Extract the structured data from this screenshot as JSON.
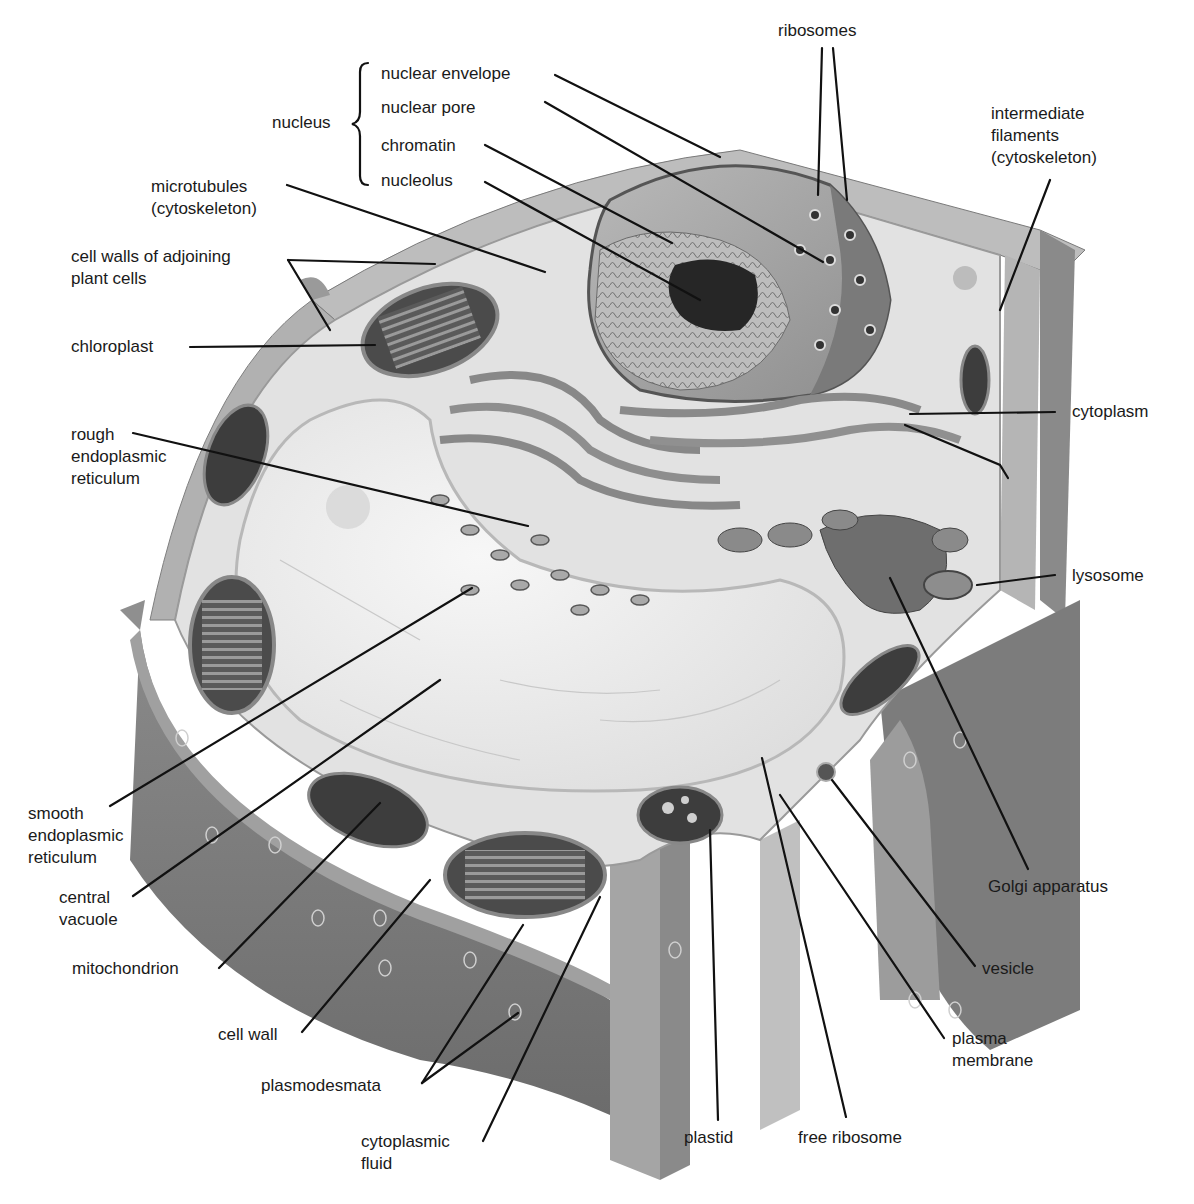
{
  "diagram": {
    "caption_partial": "",
    "palette": {
      "background": "#ffffff",
      "wall_dark": "#7a7a7a",
      "wall_mid": "#a8a8a8",
      "wall_light": "#cfcfcf",
      "cytoplasm": "#e6e6e6",
      "vacuole": "#f1f1f1",
      "organelle_dark": "#4a4a4a",
      "leader_line": "#111111"
    },
    "labels": {
      "nucleus_group": "nucleus",
      "nuclear_envelope": "nuclear envelope",
      "nuclear_pore": "nuclear pore",
      "chromatin": "chromatin",
      "nucleolus": "nucleolus",
      "ribosomes": "ribosomes",
      "intermediate_filaments": "intermediate\nfilaments\n(cytoskeleton)",
      "microtubules": "microtubules\n(cytoskeleton)",
      "cell_walls_adjoining": "cell walls of adjoining\nplant cells",
      "chloroplast": "chloroplast",
      "rough_er": "rough\nendoplasmic\nreticulum",
      "cytoplasm": "cytoplasm",
      "lysosome": "lysosome",
      "smooth_er": "smooth\nendoplasmic\nreticulum",
      "central_vacuole": "central\nvacuole",
      "golgi": "Golgi apparatus",
      "mitochondrion": "mitochondrion",
      "vesicle": "vesicle",
      "cell_wall": "cell wall",
      "plasma_membrane": "plasma\nmembrane",
      "plasmodesmata": "plasmodesmata",
      "cytoplasmic_fluid": "cytoplasmic\nfluid",
      "plastid": "plastid",
      "free_ribosome": "free ribosome"
    }
  }
}
